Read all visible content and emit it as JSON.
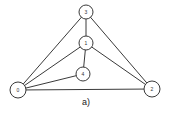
{
  "diagram": {
    "caption": "a)",
    "nodes": [
      {
        "id": "3",
        "label": "3",
        "x": 86,
        "y": 12,
        "r": 7
      },
      {
        "id": "1",
        "label": "1",
        "x": 86,
        "y": 43,
        "r": 7
      },
      {
        "id": "4",
        "label": "4",
        "x": 83,
        "y": 74,
        "r": 7
      },
      {
        "id": "0",
        "label": "0",
        "x": 18,
        "y": 90,
        "r": 8
      },
      {
        "id": "2",
        "label": "2",
        "x": 152,
        "y": 89,
        "r": 8
      }
    ],
    "edges": [
      [
        "3",
        "1"
      ],
      [
        "1",
        "4"
      ],
      [
        "3",
        "0"
      ],
      [
        "3",
        "2"
      ],
      [
        "1",
        "0"
      ],
      [
        "1",
        "2"
      ],
      [
        "4",
        "0"
      ],
      [
        "0",
        "2"
      ]
    ],
    "colors": {
      "stroke": "#3a3a3a",
      "fill": "#ffffff"
    }
  }
}
